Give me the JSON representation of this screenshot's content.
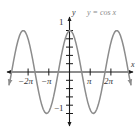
{
  "figure": {
    "background_color": "#ffffff",
    "curve_color": "#8c8c8c",
    "axis_color": "#1a1a1a",
    "label_color": "#333333",
    "equation_color": "#8a8a8a"
  },
  "equation_label": "y = cos x",
  "axes": {
    "x_axis_name": "x",
    "y_axis_name": "y",
    "x_ticks": [
      {
        "label": "−2π",
        "value": -6.2832
      },
      {
        "label": "−π",
        "value": -3.1416
      },
      {
        "label": "π",
        "value": 3.1416
      },
      {
        "label": "2π",
        "value": 6.2832
      }
    ],
    "y_ticks": [
      {
        "label": "1",
        "value": 1
      },
      {
        "label": "−1",
        "value": -1
      }
    ],
    "x_range": [
      -8.2,
      8.2
    ],
    "y_range": [
      -1.55,
      1.55
    ]
  },
  "chart_data": {
    "type": "line",
    "title": "",
    "subtitle": "",
    "xlabel": "x",
    "ylabel": "y",
    "function": "y = cos x",
    "amplitude": 1,
    "period": 6.2832,
    "grid": false,
    "legend": "none",
    "annotations": [
      "y = cos x"
    ],
    "xlim": [
      -8.2,
      8.2
    ],
    "ylim": [
      -1.55,
      1.55
    ],
    "xtick_labels": [
      "−2π",
      "−π",
      "π",
      "2π"
    ],
    "xtick_values": [
      -6.2832,
      -3.1416,
      3.1416,
      6.2832
    ],
    "ytick_labels": [
      "1",
      "−1"
    ],
    "ytick_values": [
      1,
      -1
    ],
    "maxima": [
      {
        "x": -6.2832,
        "y": 1
      },
      {
        "x": 0,
        "y": 1
      },
      {
        "x": 6.2832,
        "y": 1
      }
    ],
    "minima": [
      {
        "x": -3.1416,
        "y": -1
      },
      {
        "x": 3.1416,
        "y": -1
      }
    ],
    "zeros": [
      -4.7124,
      -1.5708,
      1.5708,
      4.7124
    ],
    "x": [
      -8.2,
      -8.0,
      -7.8,
      -7.6,
      -7.4,
      -7.2,
      -7.0,
      -6.8,
      -6.6,
      -6.4,
      -6.2,
      -6.0,
      -5.8,
      -5.6,
      -5.4,
      -5.2,
      -5.0,
      -4.8,
      -4.6,
      -4.4,
      -4.2,
      -4.0,
      -3.8,
      -3.6,
      -3.4,
      -3.2,
      -3.0,
      -2.8,
      -2.6,
      -2.4,
      -2.2,
      -2.0,
      -1.8,
      -1.6,
      -1.4,
      -1.2,
      -1.0,
      -0.8,
      -0.6,
      -0.4,
      -0.2,
      0.0,
      0.2,
      0.4,
      0.6,
      0.8,
      1.0,
      1.2,
      1.4,
      1.6,
      1.8,
      2.0,
      2.2,
      2.4,
      2.6,
      2.8,
      3.0,
      3.2,
      3.4,
      3.6,
      3.8,
      4.0,
      4.2,
      4.4,
      4.6,
      4.8,
      5.0,
      5.2,
      5.4,
      5.6,
      5.8,
      6.0,
      6.2,
      6.4,
      6.6,
      6.8,
      7.0,
      7.2,
      7.4,
      7.6,
      7.8,
      8.0,
      8.2
    ],
    "y": [
      -0.3073,
      -0.1455,
      0.054,
      0.2513,
      0.4385,
      0.6084,
      0.7539,
      0.8694,
      0.9502,
      0.9932,
      0.9965,
      0.9602,
      0.8855,
      0.7756,
      0.6347,
      0.4685,
      0.2837,
      0.0875,
      -0.1122,
      -0.3073,
      -0.4903,
      -0.6536,
      -0.791,
      -0.8968,
      -0.9668,
      -0.9983,
      -0.99,
      -0.9422,
      -0.8569,
      -0.7374,
      -0.5885,
      -0.4161,
      -0.2272,
      -0.0292,
      0.17,
      0.3624,
      0.5403,
      0.6967,
      0.8253,
      0.9211,
      0.9801,
      1.0,
      0.9801,
      0.9211,
      0.8253,
      0.6967,
      0.5403,
      0.3624,
      0.17,
      -0.0292,
      -0.2272,
      -0.4161,
      -0.5885,
      -0.7374,
      -0.8569,
      -0.9422,
      -0.99,
      -0.9983,
      -0.9668,
      -0.8968,
      -0.791,
      -0.6536,
      -0.4903,
      -0.3073,
      -0.1122,
      0.0875,
      0.2837,
      0.4685,
      0.6347,
      0.7756,
      0.8855,
      0.9602,
      0.9965,
      0.9932,
      0.9502,
      0.8694,
      0.7539,
      0.6084,
      0.4385,
      0.2513,
      0.054,
      -0.1455,
      -0.3073
    ]
  }
}
